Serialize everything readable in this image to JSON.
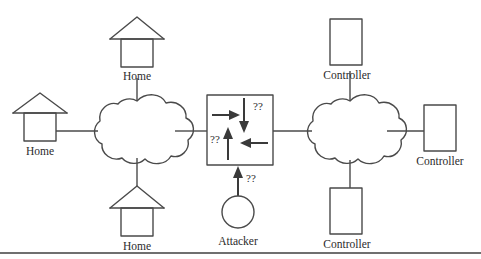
{
  "figure": {
    "kind": "network-attack-diagram",
    "background_color": "#ffffff",
    "stroke_color": "#4a4a4a",
    "text_color": "#2b2b2b",
    "width": 481,
    "height": 259
  },
  "nodes": {
    "home_top_label": "Home",
    "home_left_label": "Home",
    "home_bottom_label": "Home",
    "attacker_label": "Attacker",
    "controller_top_label": "Controller",
    "controller_right_label": "Controller",
    "controller_bottom_label": "Controller"
  },
  "annotations": {
    "q_top_right": "??",
    "q_mid_left": "??",
    "q_attacker": "??"
  }
}
